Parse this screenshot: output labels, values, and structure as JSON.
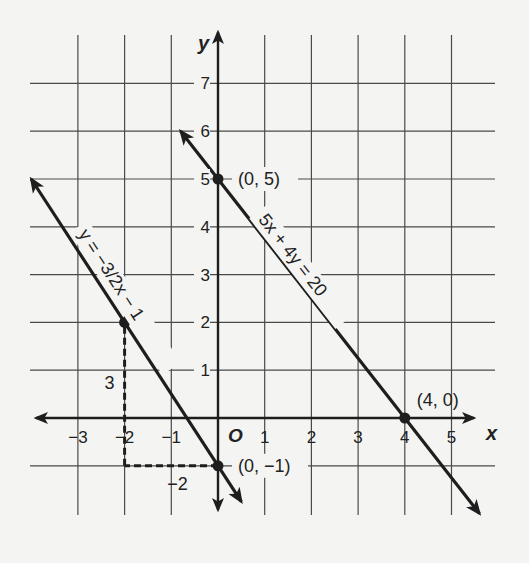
{
  "chart_data": {
    "type": "line",
    "title": "",
    "xlabel": "x",
    "ylabel": "y",
    "origin_label": "O",
    "xlim": [
      -3.5,
      5.5
    ],
    "ylim": [
      -1.5,
      7.5
    ],
    "grid": true,
    "x_ticks": [
      -3,
      -2,
      -1,
      1,
      2,
      3,
      4,
      5
    ],
    "y_ticks": [
      1,
      2,
      3,
      4,
      5,
      6,
      7
    ],
    "x_tick_labels": [
      "−3",
      "−2",
      "−1",
      "1",
      "2",
      "3",
      "4",
      "5"
    ],
    "y_tick_labels": [
      "1",
      "2",
      "3",
      "4",
      "5",
      "6",
      "7"
    ],
    "series": [
      {
        "name": "y = −3/2 x − 1",
        "equation_label": "y = −3/2x − 1",
        "slope": -1.5,
        "intercept": -1,
        "x_range": [
          -4,
          0.5
        ],
        "points": [
          {
            "x": -2,
            "y": 2,
            "label": ""
          },
          {
            "x": 0,
            "y": -1,
            "label": "(0, −1)"
          }
        ]
      },
      {
        "name": "5x + 4y = 20",
        "equation_label": "5x + 4y = 20",
        "slope": -1.25,
        "intercept": 5,
        "x_range": [
          -0.8,
          5.6
        ],
        "points": [
          {
            "x": 0,
            "y": 5,
            "label": "(0, 5)"
          },
          {
            "x": 4,
            "y": 0,
            "label": "(4, 0)"
          }
        ]
      }
    ],
    "annotations": [
      {
        "type": "rise",
        "label": "3",
        "from": {
          "x": -2,
          "y": -1
        },
        "to": {
          "x": -2,
          "y": 2
        }
      },
      {
        "type": "run",
        "label": "−2",
        "from": {
          "x": 0,
          "y": -1
        },
        "to": {
          "x": -2,
          "y": -1
        }
      }
    ]
  }
}
